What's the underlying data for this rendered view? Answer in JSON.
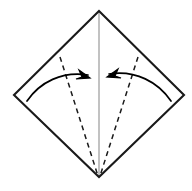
{
  "figure": {
    "title": "Origami fold diagram",
    "canvas": {
      "width": 192,
      "height": 191,
      "background": "#ffffff"
    }
  },
  "colors": {
    "outline": "#1a1a1a",
    "crease_dashed": "#1a1a1a",
    "center_line": "#b3b3b3",
    "arrow": "#000000",
    "background": "#ffffff"
  },
  "shapes": {
    "diamond": {
      "name": "square-sheet-diamond",
      "stroke_width": 2.1,
      "vertices": {
        "top": {
          "x": 99,
          "y": 11
        },
        "right": {
          "x": 184,
          "y": 95
        },
        "bottom": {
          "x": 99,
          "y": 177
        },
        "left": {
          "x": 14,
          "y": 95
        }
      },
      "points": "99,11 184,95 99,177 14,95"
    },
    "center_line": {
      "name": "vertical-center-crease",
      "stroke_width": 1.6,
      "x1": 99,
      "y1": 11,
      "x2": 99,
      "y2": 177
    },
    "crease_left": {
      "name": "left-valley-crease",
      "stroke_width": 1.5,
      "dash": "5 4",
      "x1": 60,
      "y1": 57,
      "x2": 98,
      "y2": 176
    },
    "crease_right": {
      "name": "right-valley-crease",
      "stroke_width": 1.5,
      "dash": "5 4",
      "x1": 138,
      "y1": 57,
      "x2": 100,
      "y2": 176
    }
  },
  "arrows": {
    "left": {
      "name": "left-fold-arrow",
      "stroke_width": 1.7,
      "path": "M 27,101 C 40,82 62,71 88,75",
      "head": "90,78 79,70 82,77 76,79",
      "direction": "left-edge-folds-to-center"
    },
    "right": {
      "name": "right-fold-arrow",
      "stroke_width": 1.7,
      "path": "M 171,101 C 158,82 136,70 109,74",
      "head": "107,77 118,69 115,76 121,78",
      "direction": "right-edge-folds-to-center"
    }
  }
}
